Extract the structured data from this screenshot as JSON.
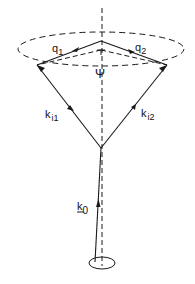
{
  "diagram": {
    "type": "vector-cone-scattering",
    "labels": {
      "q1": {
        "main": "q",
        "sub": "1"
      },
      "q2": {
        "main": "q",
        "sub": "2"
      },
      "psi": "Ψ",
      "ki1": {
        "main": "k",
        "sub": "i1"
      },
      "ki2": {
        "main": "k",
        "sub": "i2"
      },
      "k0": {
        "main": "k",
        "sub": "0"
      }
    },
    "colors": {
      "stroke": "#1a1a1a",
      "background": "#ffffff"
    }
  }
}
